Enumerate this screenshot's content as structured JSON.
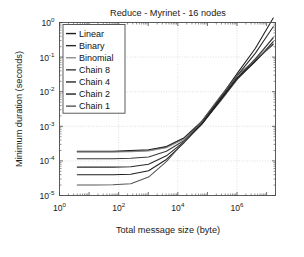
{
  "figure": {
    "title": "Reduce - Myrinet - 16 nodes",
    "xlabel": "Total message size (byte)",
    "ylabel": "Minimum duration (seconds)"
  },
  "axis_ticks": {
    "x": [
      {
        "mant": "10",
        "exp": "0"
      },
      {
        "mant": "10",
        "exp": "2"
      },
      {
        "mant": "10",
        "exp": "4"
      },
      {
        "mant": "10",
        "exp": "6"
      }
    ],
    "y": [
      {
        "mant": "10",
        "exp": "0"
      },
      {
        "mant": "10",
        "exp": "-1"
      },
      {
        "mant": "10",
        "exp": "-2"
      },
      {
        "mant": "10",
        "exp": "-3"
      },
      {
        "mant": "10",
        "exp": "-4"
      },
      {
        "mant": "10",
        "exp": "-5"
      }
    ]
  },
  "legend": {
    "items": [
      {
        "label": "Linear",
        "color": "#1d1d1d"
      },
      {
        "label": "Binary",
        "color": "#2b2b2b"
      },
      {
        "label": "Binomial",
        "color": "#8d8d8d"
      },
      {
        "label": "Chain 8",
        "color": "#3a3a3a"
      },
      {
        "label": "Chain 4",
        "color": "#272727"
      },
      {
        "label": "Chain 2",
        "color": "#1f1f1f"
      },
      {
        "label": "Chain 1",
        "color": "#555555"
      }
    ]
  },
  "chart_data": {
    "type": "line",
    "title": "Reduce - Myrinet - 16 nodes",
    "xlabel": "Total message size (byte)",
    "ylabel": "Minimum duration (seconds)",
    "xscale": "log",
    "yscale": "log",
    "xlim": [
      1,
      20000000
    ],
    "ylim": [
      1e-05,
      1
    ],
    "grid": true,
    "legend_position": "upper-left",
    "x": [
      4,
      16,
      64,
      256,
      1024,
      4096,
      16384,
      65536,
      262144,
      1048576,
      4194304,
      16777216
    ],
    "series": [
      {
        "name": "Linear",
        "color": "#1d1d1d",
        "values": [
          0.00019,
          0.00019,
          0.00019,
          0.0002,
          0.00021,
          0.00026,
          0.00047,
          0.0014,
          0.0065,
          0.035,
          0.18,
          1.35
        ]
      },
      {
        "name": "Binary",
        "color": "#2b2b2b",
        "values": [
          0.000185,
          0.000185,
          0.000185,
          0.00019,
          0.0002,
          0.00025,
          0.00045,
          0.0013,
          0.006,
          0.03,
          0.13,
          0.75
        ]
      },
      {
        "name": "Binomial",
        "color": "#8d8d8d",
        "values": [
          0.00018,
          0.00018,
          0.00018,
          0.000185,
          0.000195,
          0.00024,
          0.00043,
          0.00125,
          0.005,
          0.023,
          0.08,
          0.38
        ]
      },
      {
        "name": "Chain 8",
        "color": "#3a3a3a",
        "values": [
          0.000115,
          0.000115,
          0.000115,
          0.00012,
          0.00013,
          0.00019,
          0.00039,
          0.0012,
          0.0055,
          0.026,
          0.09,
          0.36
        ]
      },
      {
        "name": "Chain 4",
        "color": "#272727",
        "values": [
          6.6e-05,
          6.6e-05,
          6.6e-05,
          6.8e-05,
          8e-05,
          0.00014,
          0.00036,
          0.00115,
          0.0052,
          0.024,
          0.075,
          0.28
        ]
      },
      {
        "name": "Chain 2",
        "color": "#1f1f1f",
        "values": [
          4e-05,
          4e-05,
          4e-05,
          4.1e-05,
          5.2e-05,
          0.00011,
          0.00034,
          0.0012,
          0.0056,
          0.026,
          0.078,
          0.24
        ]
      },
      {
        "name": "Chain 1",
        "color": "#555555",
        "values": [
          2e-05,
          2e-05,
          2.05e-05,
          2.2e-05,
          3.4e-05,
          9.5e-05,
          0.00036,
          0.00145,
          0.007,
          0.03,
          0.085,
          0.23
        ]
      }
    ]
  }
}
